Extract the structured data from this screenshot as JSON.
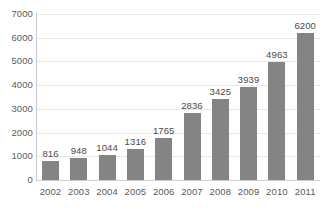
{
  "chart_data": {
    "type": "bar",
    "title": "",
    "subtitle": "",
    "xlabel": "",
    "ylabel": "",
    "categories": [
      "2002",
      "2003",
      "2004",
      "2005",
      "2006",
      "2007",
      "2008",
      "2009",
      "2010",
      "2011"
    ],
    "values": [
      816,
      948,
      1044,
      1316,
      1765,
      2836,
      3425,
      3939,
      4963,
      6200
    ],
    "data_labels": [
      "816",
      "948",
      "1044",
      "1316",
      "1765",
      "2836",
      "3425",
      "3939",
      "4963",
      "6200"
    ],
    "ylim": [
      0,
      7000
    ],
    "y_ticks": [
      0,
      1000,
      2000,
      3000,
      4000,
      5000,
      6000,
      7000
    ],
    "y_tick_labels": [
      "0",
      "1000",
      "2000",
      "3000",
      "4000",
      "5000",
      "6000",
      "7000"
    ],
    "grid": true,
    "grid_axis": "y",
    "legend": false,
    "legend_position": "none",
    "series": [
      {
        "name": "",
        "values": [
          816,
          948,
          1044,
          1316,
          1765,
          2836,
          3425,
          3939,
          4963,
          6200
        ]
      }
    ],
    "colors": {
      "bar": "#848484",
      "gridline": "#e8e8e8",
      "axis": "#c9c9c9",
      "text": "#5a5a5a",
      "background": "#ffffff"
    }
  }
}
